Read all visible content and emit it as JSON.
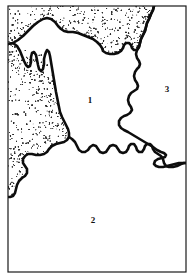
{
  "figure": {
    "type": "line-drawing-map",
    "title": "",
    "frame": {
      "x": 8,
      "y": 6,
      "width": 178,
      "height": 266,
      "stroke_color": "#1a1a1a",
      "stroke_width": 1.2,
      "fill_color": "#ffffff"
    },
    "background_color": "#ffffff",
    "ink_color": "#0d0d0d",
    "stipple_color": "#2a2a2a"
  },
  "map_data": {
    "type": "region-map",
    "coastline_stroke_width": 2.6,
    "regions": [
      {
        "id": "region-1",
        "label": "1",
        "label_x": 90,
        "label_y": 101,
        "fill": "#ffffff",
        "description": "central unshaded region bounded by stippled coast to north and west, jagged boundary to east and south"
      },
      {
        "id": "region-2",
        "label": "2",
        "label_x": 93,
        "label_y": 221,
        "fill": "#ffffff",
        "description": "southern unshaded region below the jagged southern boundary"
      },
      {
        "id": "region-3",
        "label": "3",
        "label_x": 167,
        "label_y": 90,
        "fill": "#ffffff",
        "description": "eastern unshaded region right of the jagged north-south boundary"
      }
    ],
    "stippled_area": {
      "id": "stippled-land",
      "label": "",
      "pattern": "random-dot-stipple",
      "dot_radius_min": 0.28,
      "dot_radius_max": 0.62,
      "density_near_edge": "high",
      "density_far_edge": "low",
      "description": "stippled landmass occupying the north and west margins of the frame"
    },
    "coastline_path": "M 8 44 L 13 43 L 18 40 L 23 36 L 28 31 L 33 26 L 38 22 L 43 19 L 47 18 L 51 19 L 55 22 L 58 26 L 61 29 L 64 31 L 68 32 L 73 32 L 78 33 L 83 35 L 88 37 L 93 39 L 97 42 L 100 45 L 102 48 L 103 51 L 106 53 L 110 54 L 114 54 L 118 53 L 121 51 L 123 48 L 124 45 L 126 43 L 129 43 L 131 45 L 132 48 L 134 50 L 137 50 L 139 47 L 140 43 L 141 39 L 143 35 L 145 31 L 146 27 L 147 23 L 149 19 L 151 14 L 153 10 L 154 6",
    "inner_boundary_path": "M 154 6 L 153 10 L 151 14 L 149 19 L 147 23 L 146 27 L 145 31 L 143 35 L 141 39 L 140 43 L 139 47 L 137 50 L 136 54 L 137 58 L 139 61 L 140 64 L 139 67 L 137 69 L 135 72 L 134 76 L 135 80 L 137 83 L 138 86 L 137 89 L 134 91 L 131 93 L 129 96 L 128 100 L 129 104 L 131 107 L 132 110 L 130 113 L 127 115 L 124 116 L 121 118 L 119 121 L 119 125 L 121 128 L 124 130 L 128 132 L 133 135 L 138 138 L 143 141 L 148 144 L 153 147 L 157 150 L 161 152 L 164 153 L 166 155 L 165 157 L 162 158 L 158 159 L 155 161 L 154 164 L 156 166 L 159 167 L 163 167 L 167 166 L 171 165 L 175 164 L 179 163 L 183 163 L 186 163",
    "west_coast_path": "M 8 44 L 13 43 L 17 46 L 20 51 L 22 56 L 24 61 L 26 65 L 28 67 L 30 66 L 31 62 L 31 57 L 32 53 L 34 52 L 36 55 L 37 60 L 38 65 L 39 69 L 41 71 L 43 69 L 44 64 L 44 59 L 45 55 L 46 52 L 47 50 L 49 52 L 50 56 L 51 62 L 52 68 L 53 74 L 54 80 L 55 86 L 56 92 L 57 97 L 58 102 L 59 107 L 60 112 L 62 117 L 64 121 L 66 125 L 68 129 L 69 133 L 69 137 L 67 140 L 64 142 L 60 143 L 56 144 L 52 146 L 49 149 L 47 152 L 44 154 L 40 155 L 36 155 L 32 154 L 28 154 L 25 156 L 23 159 L 23 163 L 25 166 L 27 169 L 27 173 L 25 176 L 22 178 L 19 181 L 17 185 L 16 189 L 15 193 L 13 196 L 10 197 L 8 197",
    "south_boundary_path": "M 69 137 L 72 139 L 75 142 L 77 146 L 79 150 L 82 152 L 85 152 L 88 150 L 90 147 L 93 145 L 96 146 L 98 149 L 100 152 L 103 153 L 106 152 L 108 149 L 110 146 L 113 145 L 116 146 L 118 149 L 120 152 L 123 153 L 126 152 L 128 149 L 129 146 L 131 144 L 134 144 L 136 147 L 137 150 L 139 152 L 142 152 L 144 149 L 145 146 L 147 144 L 150 144 L 152 146 L 153 149 L 155 152 L 158 154 L 161 156 L 163 159 L 164 163 L 166 166 L 169 167 L 173 167 L 177 166 L 181 164 L 184 163 L 186 163"
  },
  "labels": {
    "zone_1": "1",
    "zone_2": "2",
    "zone_3": "3"
  }
}
